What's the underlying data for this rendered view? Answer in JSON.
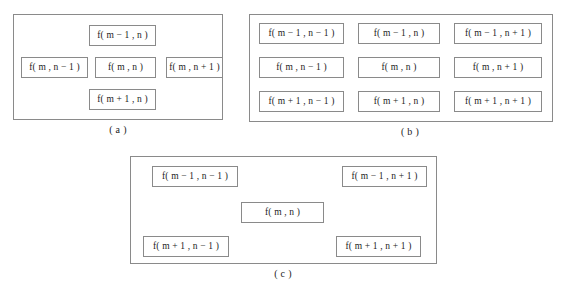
{
  "figure": {
    "line_color": "#8a8a8a",
    "background_color": "#ffffff",
    "text_color": "#1d1d1d"
  },
  "panels": [
    {
      "id": "a",
      "caption": "( a )",
      "layout": "five-point cross stencil",
      "cells": [
        {
          "key": "top",
          "label": "f( m − 1 , n )"
        },
        {
          "key": "left",
          "label": "f( m , n − 1 )"
        },
        {
          "key": "center",
          "label": "f( m , n )"
        },
        {
          "key": "right",
          "label": "f( m , n + 1 )"
        },
        {
          "key": "bottom",
          "label": "f( m + 1 , n )"
        }
      ]
    },
    {
      "id": "b",
      "caption": "( b )",
      "layout": "nine-point full stencil (3 by 3 grid)",
      "rows": [
        [
          {
            "key": "r0c0",
            "label": "f( m − 1 , n − 1 )"
          },
          {
            "key": "r0c1",
            "label": "f( m − 1 , n )"
          },
          {
            "key": "r0c2",
            "label": "f( m − 1 , n + 1 )"
          }
        ],
        [
          {
            "key": "r1c0",
            "label": "f( m , n − 1 )"
          },
          {
            "key": "r1c1",
            "label": "f( m , n )"
          },
          {
            "key": "r1c2",
            "label": "f( m , n + 1 )"
          }
        ],
        [
          {
            "key": "r2c0",
            "label": "f( m + 1 , n − 1 )"
          },
          {
            "key": "r2c1",
            "label": "f( m + 1 , n )"
          },
          {
            "key": "r2c2",
            "label": "f( m + 1 , n + 1 )"
          }
        ]
      ]
    },
    {
      "id": "c",
      "caption": "( c )",
      "layout": "five-point diagonal (X) stencil",
      "cells": [
        {
          "key": "topleft",
          "label": "f( m − 1 , n − 1 )"
        },
        {
          "key": "topright",
          "label": "f( m − 1 , n + 1 )"
        },
        {
          "key": "center",
          "label": "f( m , n )"
        },
        {
          "key": "bottomleft",
          "label": "f( m + 1 , n − 1 )"
        },
        {
          "key": "bottomright",
          "label": "f( m + 1 , n + 1 )"
        }
      ]
    }
  ]
}
